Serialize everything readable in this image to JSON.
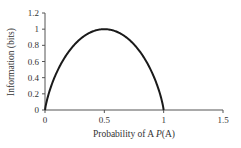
{
  "chart_data": {
    "type": "line",
    "title": "",
    "xlabel": "Probability of A P(A)",
    "xlabel_parts": {
      "prefix": "Probability of A ",
      "italic": "P",
      "suffix": "(A)"
    },
    "ylabel": "Information (bits)",
    "xlim": [
      0,
      1.5
    ],
    "ylim": [
      0,
      1.2
    ],
    "x_ticks": [
      0,
      0.5,
      1,
      1.5
    ],
    "x_tick_labels": [
      "0",
      "0.5",
      "1",
      "1.5"
    ],
    "y_ticks": [
      0,
      0.2,
      0.4,
      0.6,
      0.8,
      1,
      1.2
    ],
    "y_tick_labels": [
      "0",
      "0.2",
      "0.4",
      "0.6",
      "0.8",
      "1",
      "1.2"
    ],
    "grid": false,
    "legend": null,
    "series": [
      {
        "name": "Binary entropy H(p)",
        "color": "#1a1a1a",
        "x": [
          0,
          0.01,
          0.05,
          0.1,
          0.15,
          0.2,
          0.25,
          0.3,
          0.35,
          0.4,
          0.45,
          0.5,
          0.55,
          0.6,
          0.65,
          0.7,
          0.75,
          0.8,
          0.85,
          0.9,
          0.95,
          0.99,
          1
        ],
        "y": [
          0,
          0.081,
          0.286,
          0.469,
          0.61,
          0.722,
          0.811,
          0.881,
          0.934,
          0.971,
          0.993,
          1,
          0.993,
          0.971,
          0.934,
          0.881,
          0.811,
          0.722,
          0.61,
          0.469,
          0.286,
          0.081,
          0
        ]
      }
    ]
  },
  "colors": {
    "axis": "#555555",
    "curve": "#1a1a1a",
    "text": "#333333"
  }
}
